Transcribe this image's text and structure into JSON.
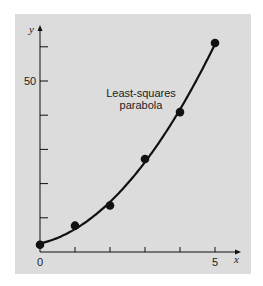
{
  "chart_data": {
    "type": "scatter",
    "title": "",
    "xlabel": "x",
    "ylabel": "y",
    "xlim": [
      0,
      5.7
    ],
    "ylim": [
      0,
      65
    ],
    "x_ticks": [
      0,
      1,
      2,
      3,
      4,
      5
    ],
    "x_tick_labels": [
      "0",
      "",
      "",
      "",
      "",
      "5"
    ],
    "y_ticks": [
      10,
      20,
      30,
      40,
      50,
      60
    ],
    "y_tick_labels": [
      "",
      "",
      "",
      "",
      "50",
      ""
    ],
    "grid": false,
    "series": [
      {
        "name": "data",
        "kind": "points",
        "x": [
          0,
          1,
          2,
          3,
          4,
          5
        ],
        "y": [
          2.1,
          7.7,
          13.6,
          27.2,
          40.9,
          61.1
        ]
      },
      {
        "name": "Least-squares parabola",
        "kind": "curve",
        "equation": "y = 2.47857 + 2.35929x + 1.86071x^2",
        "coefficients": [
          2.47857,
          2.35929,
          1.86071
        ]
      }
    ],
    "annotations": [
      {
        "text": "Least-squares parabola",
        "x": 2.9,
        "y": 48
      }
    ],
    "colors": {
      "background": "#dcdcdc",
      "ink": "#111111"
    }
  },
  "labels": {
    "y_axis": "y",
    "x_axis": "x",
    "x_origin": "0",
    "x_five": "5",
    "y_fifty": "50",
    "annotation_line1": "Least-squares",
    "annotation_line2": "parabola"
  }
}
